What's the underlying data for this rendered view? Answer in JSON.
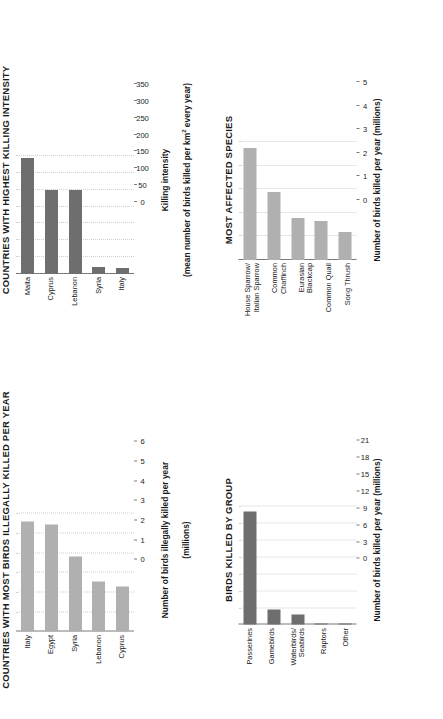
{
  "chart_data": [
    {
      "id": "killing-intensity",
      "type": "bar",
      "orientation": "vertical-rotated",
      "title": "COUNTRIES WITH HIGHEST KILLING INTENSITY",
      "categories": [
        "Malta",
        "Cyprus",
        "Lebanon",
        "Syria",
        "Italy"
      ],
      "values": [
        343,
        248,
        248,
        22,
        18
      ],
      "ticks": [
        0,
        50,
        100,
        150,
        200,
        250,
        300,
        350
      ],
      "ylim": [
        0,
        350
      ],
      "xlabel": "",
      "ylabel": "Killing intensity\n(mean number of birds killed per km² every year)",
      "ylabel_line1": "Killing intensity",
      "ylabel_line2": "(mean number of birds killed per km",
      "ylabel_line2_sup": "2",
      "ylabel_line2_end": " every year)",
      "grid": true,
      "legend": "none",
      "bar_color": "#6e6e6e"
    },
    {
      "id": "most-affected-species",
      "type": "bar",
      "orientation": "vertical-rotated",
      "title": "MOST AFFECTED SPECIES",
      "categories": [
        "House Sparrow/\nItalian Sparrow",
        "Common\nChaffinch",
        "Eurasian\nBlackcap",
        "Common Quail",
        "Song Thrush"
      ],
      "values": [
        4.75,
        2.9,
        1.8,
        1.65,
        1.2
      ],
      "ticks": [
        0,
        1,
        2,
        3,
        4,
        5
      ],
      "ylim": [
        0,
        5
      ],
      "xlabel": "",
      "ylabel": "Number of birds killed per year (millions)",
      "grid": true,
      "legend": "none",
      "bar_color": "#b0b0b0"
    },
    {
      "id": "most-birds-killed",
      "type": "bar",
      "orientation": "vertical-rotated",
      "title": "COUNTRIES WITH MOST BIRDS ILLEGALLY KILLED PER YEAR",
      "categories": [
        "Italy",
        "Egypt",
        "Syria",
        "Lebanon",
        "Cyprus"
      ],
      "values": [
        5.6,
        5.45,
        3.85,
        2.55,
        2.3
      ],
      "ticks": [
        0,
        1,
        2,
        3,
        4,
        5,
        6
      ],
      "ylim": [
        0,
        6
      ],
      "xlabel": "",
      "ylabel": "Number of birds illegally killed per year\n(millions)",
      "ylabel_line1": "Number of birds illegally killed per year",
      "ylabel_line2": "(millions)",
      "grid": true,
      "legend": "none",
      "bar_color": "#b0b0b0"
    },
    {
      "id": "birds-killed-by-group",
      "type": "bar",
      "orientation": "vertical-rotated",
      "title": "BIRDS KILLED BY GROUP",
      "categories": [
        "Passerines",
        "Gamebirds",
        "Waterbirds/\nSeabirds",
        "Raptors",
        "Other"
      ],
      "values": [
        20.2,
        2.7,
        1.9,
        0.15,
        0.02
      ],
      "ticks": [
        0,
        3,
        6,
        9,
        12,
        15,
        18,
        21
      ],
      "ylim": [
        0,
        21
      ],
      "xlabel": "",
      "ylabel": "Number of birds killed per year (millions)",
      "grid": true,
      "legend": "none",
      "bar_color": "#6e6e6e"
    }
  ],
  "colors": {
    "bar_dark": "#6e6e6e",
    "bar_light": "#b0b0b0",
    "axis": "#7a7a7a",
    "grid": "#cfcfcf",
    "text": "#1a1a1a",
    "background": "#ffffff"
  }
}
